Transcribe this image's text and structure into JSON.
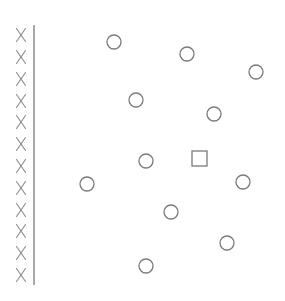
{
  "diagram": {
    "stroke_color": "#7a7a7a",
    "x_color": "#8a8a8a",
    "background": "#ffffff",
    "x_column": {
      "glyph": "X",
      "x": 21,
      "count": 12,
      "y_positions": [
        35,
        57,
        79,
        101,
        122,
        144,
        166,
        188,
        210,
        231,
        253,
        275
      ]
    },
    "divider_line": {
      "x": 34,
      "y1": 25,
      "y2": 285
    },
    "circles": [
      {
        "cx": 114,
        "cy": 42,
        "r": 7
      },
      {
        "cx": 187,
        "cy": 54,
        "r": 7
      },
      {
        "cx": 256,
        "cy": 72,
        "r": 7
      },
      {
        "cx": 136,
        "cy": 100,
        "r": 7
      },
      {
        "cx": 214,
        "cy": 114,
        "r": 7
      },
      {
        "cx": 146,
        "cy": 161,
        "r": 7
      },
      {
        "cx": 87,
        "cy": 184,
        "r": 7
      },
      {
        "cx": 243,
        "cy": 182,
        "r": 7
      },
      {
        "cx": 171,
        "cy": 212,
        "r": 7
      },
      {
        "cx": 227,
        "cy": 243,
        "r": 7
      },
      {
        "cx": 146,
        "cy": 266,
        "r": 7
      }
    ],
    "squares": [
      {
        "x": 192,
        "y": 151,
        "size": 15
      }
    ]
  }
}
